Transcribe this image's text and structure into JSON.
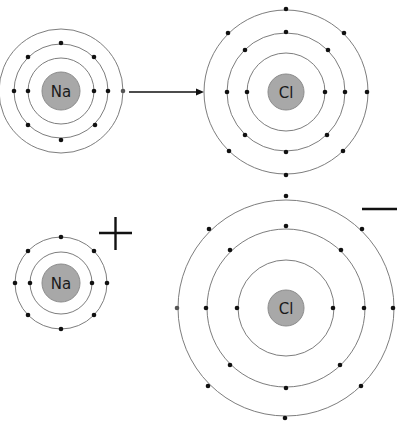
{
  "diagram": {
    "colors": {
      "nucleus": "#a8a8a8",
      "orbit": "#6e6e6e",
      "electron": "#111111"
    },
    "before": {
      "sodium": {
        "symbol": "Na",
        "center": [
          61,
          91
        ],
        "shells": [
          {
            "radius": 33,
            "electrons": 2
          },
          {
            "radius": 47,
            "electrons": 8
          },
          {
            "radius": 62,
            "electrons": 1
          }
        ]
      },
      "chlorine": {
        "symbol": "Cl",
        "center": [
          286,
          92
        ],
        "shells": [
          {
            "radius": 39,
            "electrons": 2
          },
          {
            "radius": 59,
            "electrons": 8
          },
          {
            "radius": 82,
            "electrons": 7
          }
        ]
      },
      "transfer_arrow": {
        "from": [
          129,
          92
        ],
        "to": [
          203,
          92
        ],
        "meaning": "electron transfer from Na to Cl"
      }
    },
    "after": {
      "sodium_ion": {
        "symbol": "Na",
        "charge": "+",
        "center": [
          61,
          283
        ],
        "shells": [
          {
            "radius": 31,
            "electrons": 2
          },
          {
            "radius": 46,
            "electrons": 8
          }
        ]
      },
      "chloride_ion": {
        "symbol": "Cl",
        "charge": "−",
        "center": [
          286,
          308
        ],
        "shells": [
          {
            "radius": 48,
            "electrons": 2
          },
          {
            "radius": 79,
            "electrons": 8
          },
          {
            "radius": 108,
            "electrons": 8
          }
        ]
      }
    }
  }
}
